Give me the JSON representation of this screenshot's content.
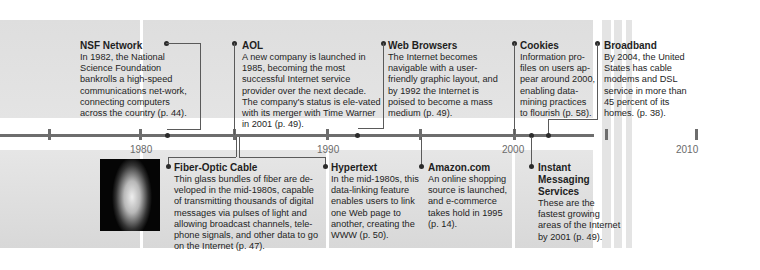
{
  "axis": {
    "years": [
      "1980",
      "1990",
      "2000",
      "2010"
    ]
  },
  "events_top": [
    {
      "title": "NSF Network",
      "body": "In 1982, the National Science Foundation bankrolls a high-speed communications net-work, connecting computers across the country (p. 44)."
    },
    {
      "title": "AOL",
      "body": "A new company is launched in 1985, becoming the most successful Internet service provider over the next decade. The company's status is ele-vated with its merger with Time Warner in 2001 (p. 49)."
    },
    {
      "title": "Web Browsers",
      "body": "The Internet becomes navigable with a user-friendly graphic layout, and by 1992 the Internet is poised to become a mass medium (p. 49)."
    },
    {
      "title": "Cookies",
      "body": "Information pro-files on users ap-pear around 2000, enabling data-mining practices to flourish (p. 58)."
    },
    {
      "title": "Broadband",
      "body": "By 2004, the United States has cable modems and DSL service in more than 45 percent of its homes. (p. 38)."
    }
  ],
  "events_bottom": [
    {
      "title": "Fiber-Optic Cable",
      "body": "Thin glass bundles of fiber are de-veloped in the mid-1980s, capable of transmitting thousands of digital messages via pulses of light and allowing broadcast channels, tele-phone signals, and other data to go on the Internet (p. 47)."
    },
    {
      "title": "Hypertext",
      "body": "In the mid-1980s, this data-linking feature enables users to link one Web page to another, creating the WWW (p. 50)."
    },
    {
      "title": "Amazon.com",
      "body": "An online shopping source is launched, and e-commerce takes hold in 1995 (p. 14)."
    },
    {
      "title": "Instant Messaging Services",
      "body": "These are the fastest growing areas of the Internet by 2001 (p. 49)."
    }
  ],
  "image": {
    "caption": "fiber-optic-photo"
  }
}
